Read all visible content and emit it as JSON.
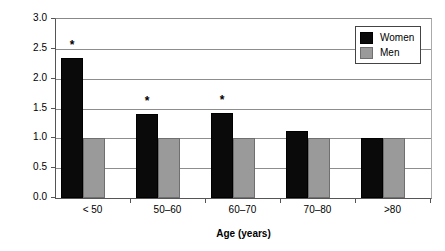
{
  "chart_data": {
    "type": "bar",
    "title": "",
    "subtitle": "",
    "xlabel": "Age (years)",
    "ylabel": "Ratio",
    "categories": [
      "< 50",
      "50–60",
      "60–70",
      "70–80",
      ">80"
    ],
    "series": [
      {
        "name": "Women",
        "color": "#0a0a0a",
        "values": [
          2.35,
          1.4,
          1.43,
          1.13,
          1.0
        ]
      },
      {
        "name": "Men",
        "color": "#9a9a9a",
        "values": [
          1.0,
          1.0,
          1.0,
          1.0,
          1.0
        ]
      }
    ],
    "ylim": [
      0.0,
      3.0
    ],
    "yticks": [
      "3.0",
      "2.5",
      "2.0",
      "1.5",
      "1.0",
      "0.5",
      "0.0"
    ],
    "ytick_values": [
      3.0,
      2.5,
      2.0,
      1.5,
      1.0,
      0.5,
      0.0
    ],
    "grid": "horizontal",
    "legend_position": "top-right",
    "annotations": [
      {
        "label": "*",
        "category": "< 50",
        "series": "Women",
        "value": 2.35
      },
      {
        "label": "*",
        "category": "50–60",
        "series": "Women",
        "value": 1.4
      },
      {
        "label": "*",
        "category": "60–70",
        "series": "Women",
        "value": 1.43
      }
    ]
  },
  "legend": {
    "items": [
      {
        "label": "Women",
        "swatch": "black-square-swatch"
      },
      {
        "label": "Men",
        "swatch": "gray-square-swatch"
      }
    ]
  }
}
